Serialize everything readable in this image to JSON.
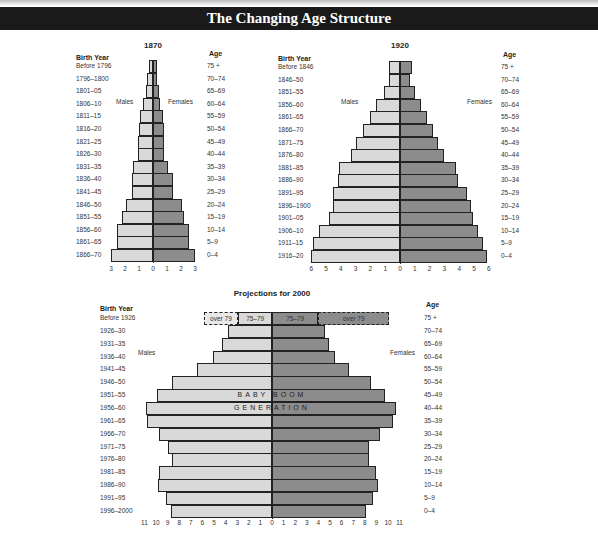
{
  "title": "The Changing Age Structure",
  "chart_data": [
    {
      "type": "bar",
      "subtype": "population-pyramid",
      "title": "1870",
      "left_header": "Birth Year",
      "right_header": "Age",
      "left_series_label": "Males",
      "right_series_label": "Females",
      "age_groups": [
        "75 +",
        "70–74",
        "65–69",
        "60–64",
        "55–59",
        "50–54",
        "45–49",
        "40–44",
        "35–39",
        "30–34",
        "25–29",
        "20–24",
        "15–19",
        "10–14",
        "5–9",
        "0–4"
      ],
      "birth_years": [
        "Before 1796",
        "1796–1800",
        "1801–05",
        "1806–10",
        "1811–15",
        "1816–20",
        "1821–25",
        "1826–30",
        "1831–35",
        "1836–40",
        "1841–45",
        "1846–50",
        "1851–55",
        "1856–60",
        "1861–65",
        "1866–70"
      ],
      "series": [
        {
          "name": "Males",
          "values": [
            0.3,
            0.4,
            0.5,
            0.7,
            0.9,
            1.0,
            1.1,
            1.1,
            1.4,
            1.5,
            1.5,
            1.9,
            2.2,
            2.6,
            2.6,
            3.0
          ]
        },
        {
          "name": "Females",
          "values": [
            0.3,
            0.3,
            0.4,
            0.5,
            0.7,
            0.8,
            0.8,
            0.8,
            1.1,
            1.4,
            1.4,
            2.1,
            2.2,
            2.6,
            2.6,
            3.0
          ]
        }
      ],
      "x_ticks": [
        "3",
        "2",
        "1",
        "0",
        "1",
        "2",
        "3"
      ],
      "xlim": [
        -3,
        3
      ]
    },
    {
      "type": "bar",
      "subtype": "population-pyramid",
      "title": "1920",
      "left_header": "Birth Year",
      "right_header": "Age",
      "left_series_label": "Males",
      "right_series_label": "Females",
      "age_groups": [
        "75 +",
        "70–74",
        "65–69",
        "60–64",
        "55–59",
        "50–54",
        "45–49",
        "40–44",
        "35–39",
        "30–34",
        "25–29",
        "20–24",
        "15–19",
        "10–14",
        "5–9",
        "0–4"
      ],
      "birth_years": [
        "Before 1846",
        "1846–50",
        "1851–55",
        "1856–60",
        "1861–65",
        "1866–70",
        "1871–75",
        "1876–80",
        "1881–85",
        "1886–90",
        "1891–95",
        "1896–1900",
        "1901–05",
        "1906–10",
        "1911–15",
        "1916–20"
      ],
      "series": [
        {
          "name": "Males",
          "values": [
            0.75,
            0.75,
            1.1,
            1.6,
            2.0,
            2.5,
            3.0,
            3.3,
            4.1,
            4.2,
            4.5,
            4.5,
            4.8,
            5.5,
            5.9,
            6.0
          ]
        },
        {
          "name": "Females",
          "values": [
            0.8,
            0.7,
            1.0,
            1.4,
            1.8,
            2.2,
            2.6,
            3.0,
            3.8,
            3.9,
            4.5,
            4.8,
            4.9,
            5.3,
            5.6,
            5.9
          ]
        }
      ],
      "x_ticks": [
        "6",
        "5",
        "4",
        "3",
        "2",
        "1",
        "0",
        "1",
        "2",
        "3",
        "4",
        "5",
        "6"
      ],
      "xlim": [
        -6,
        6
      ]
    },
    {
      "type": "bar",
      "subtype": "population-pyramid",
      "title": "Projections for 2000",
      "left_header": "Birth Year",
      "right_header": "Age",
      "left_series_label": "Males",
      "right_series_label": "Females",
      "age_groups": [
        "75 +",
        "70–74",
        "65–69",
        "60–64",
        "55–59",
        "50–54",
        "45–49",
        "40–44",
        "35–39",
        "30–34",
        "25–29",
        "20–24",
        "15–19",
        "10–14",
        "5–9",
        "0–4"
      ],
      "birth_years": [
        "Before 1926",
        "1926–30",
        "1931–35",
        "1936–40",
        "1941–45",
        "1946–50",
        "1951–55",
        "1956–60",
        "1961–65",
        "1966–70",
        "1971–75",
        "1976–80",
        "1981–85",
        "1986–90",
        "1991–95",
        "1996–2000"
      ],
      "series": [
        {
          "name": "Males",
          "values": [
            2.9,
            3.8,
            4.3,
            5.1,
            6.5,
            8.6,
            9.9,
            10.9,
            10.8,
            9.7,
            9.0,
            8.6,
            9.7,
            9.8,
            9.1,
            8.7
          ]
        },
        {
          "name": "Females",
          "values": [
            4.0,
            4.6,
            4.9,
            5.4,
            6.6,
            8.5,
            9.7,
            10.7,
            10.4,
            9.3,
            8.4,
            8.4,
            9.0,
            9.1,
            8.7,
            8.1
          ]
        }
      ],
      "top_segment": {
        "male": [
          {
            "label": "over 79",
            "value": 3.0,
            "dashed": true
          },
          {
            "label": "75–79",
            "value": 2.9
          }
        ],
        "female": [
          {
            "label": "75–79",
            "value": 4.0
          },
          {
            "label": "over 79",
            "value": 6.1,
            "dashed": true
          }
        ]
      },
      "annotations": [
        "BABY BOOM",
        "GENERATION"
      ],
      "x_ticks": [
        "11",
        "10",
        "9",
        "8",
        "7",
        "6",
        "5",
        "4",
        "3",
        "2",
        "1",
        "0",
        "1",
        "2",
        "3",
        "4",
        "5",
        "6",
        "7",
        "8",
        "9",
        "10",
        "11"
      ],
      "xlim": [
        -11,
        11
      ]
    }
  ],
  "colors": {
    "male": "#d9d9d9",
    "female": "#8c8c8c",
    "banner": "#1a1a1a"
  }
}
